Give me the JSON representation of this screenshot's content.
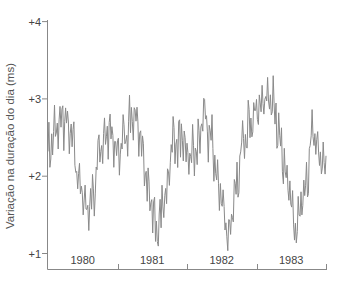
{
  "chart_data": {
    "type": "line",
    "title": "",
    "xlabel": "",
    "ylabel": "Variação na duração do dia (ms)",
    "ylim": [
      1,
      4
    ],
    "xlim": [
      1980,
      1984
    ],
    "y_ticks": [
      {
        "value": 4,
        "label": "+4"
      },
      {
        "value": 3,
        "label": "+3"
      },
      {
        "value": 2,
        "label": "+2"
      },
      {
        "value": 1,
        "label": "+1"
      }
    ],
    "x_categories": [
      "1980",
      "1981",
      "1982",
      "1983"
    ],
    "grid": false,
    "legend": null,
    "line_color": "#8a8a8a",
    "series": [
      {
        "name": "Variação na duração do dia",
        "envelope_note": "Approximate smoothed trend with high-frequency oscillation; values in ms",
        "trend_points": [
          {
            "x": 1980.0,
            "y": 2.3
          },
          {
            "x": 1980.1,
            "y": 2.55
          },
          {
            "x": 1980.22,
            "y": 2.75
          },
          {
            "x": 1980.32,
            "y": 2.55
          },
          {
            "x": 1980.45,
            "y": 1.95
          },
          {
            "x": 1980.55,
            "y": 1.55
          },
          {
            "x": 1980.65,
            "y": 1.75
          },
          {
            "x": 1980.75,
            "y": 2.4
          },
          {
            "x": 1980.88,
            "y": 2.55
          },
          {
            "x": 1981.0,
            "y": 2.3
          },
          {
            "x": 1981.12,
            "y": 2.55
          },
          {
            "x": 1981.22,
            "y": 2.8
          },
          {
            "x": 1981.35,
            "y": 2.4
          },
          {
            "x": 1981.47,
            "y": 1.7
          },
          {
            "x": 1981.57,
            "y": 1.3
          },
          {
            "x": 1981.68,
            "y": 1.7
          },
          {
            "x": 1981.8,
            "y": 2.45
          },
          {
            "x": 1981.92,
            "y": 2.45
          },
          {
            "x": 1982.0,
            "y": 2.25
          },
          {
            "x": 1982.12,
            "y": 2.3
          },
          {
            "x": 1982.25,
            "y": 2.75
          },
          {
            "x": 1982.35,
            "y": 2.45
          },
          {
            "x": 1982.47,
            "y": 1.8
          },
          {
            "x": 1982.6,
            "y": 1.25
          },
          {
            "x": 1982.7,
            "y": 1.75
          },
          {
            "x": 1982.82,
            "y": 2.55
          },
          {
            "x": 1982.95,
            "y": 2.75
          },
          {
            "x": 1983.08,
            "y": 2.95
          },
          {
            "x": 1983.2,
            "y": 3.05
          },
          {
            "x": 1983.32,
            "y": 2.6
          },
          {
            "x": 1983.45,
            "y": 1.85
          },
          {
            "x": 1983.57,
            "y": 1.3
          },
          {
            "x": 1983.68,
            "y": 1.7
          },
          {
            "x": 1983.82,
            "y": 2.55
          },
          {
            "x": 1983.92,
            "y": 2.2
          },
          {
            "x": 1984.0,
            "y": 2.05
          }
        ],
        "oscillation_amplitude": 0.38,
        "samples": 300
      }
    ],
    "notable_values": {
      "max": {
        "x": 1983.15,
        "y": 3.6
      },
      "min_1981": {
        "x": 1981.55,
        "y": 1.05
      },
      "min_1982": {
        "x": 1982.62,
        "y": 1.05
      },
      "min_1983": {
        "x": 1983.56,
        "y": 1.05
      }
    }
  },
  "layout": {
    "plot_left": 48,
    "plot_right": 326,
    "plot_top": 21,
    "plot_bottom": 269,
    "y_px_at_1": 253,
    "y_px_per_unit": 77.3
  }
}
